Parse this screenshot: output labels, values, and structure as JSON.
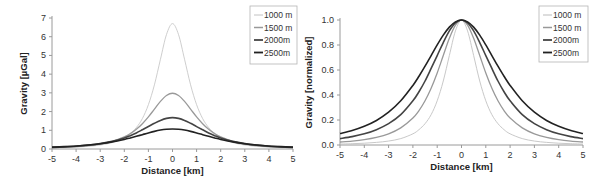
{
  "chart_data": [
    {
      "type": "line",
      "title": "",
      "xlabel": "Distance [km]",
      "ylabel": "Gravity [µGal]",
      "xlim": [
        -5,
        5
      ],
      "ylim": [
        0,
        7
      ],
      "xticks": [
        "-5",
        "-4",
        "-3",
        "-2",
        "-1",
        "0",
        "1",
        "2",
        "3",
        "4",
        "5"
      ],
      "yticks": [
        "0",
        "1",
        "2",
        "3",
        "4",
        "5",
        "6",
        "7"
      ],
      "legend_position": "top-right",
      "x": [
        -5,
        -4.5,
        -4,
        -3.5,
        -3,
        -2.5,
        -2,
        -1.75,
        -1.5,
        -1.25,
        -1,
        -0.75,
        -0.5,
        -0.25,
        0,
        0.25,
        0.5,
        0.75,
        1,
        1.25,
        1.5,
        1.75,
        2,
        2.5,
        3,
        3.5,
        4,
        4.5,
        5
      ],
      "series": [
        {
          "name": "1000 m",
          "color": "#c2c2c2",
          "values": [
            0.05,
            0.069,
            0.096,
            0.141,
            0.212,
            0.343,
            0.599,
            0.823,
            1.144,
            1.627,
            2.369,
            3.43,
            4.794,
            6.114,
            6.7,
            6.114,
            4.794,
            3.43,
            2.369,
            1.627,
            1.144,
            0.823,
            0.599,
            0.343,
            0.212,
            0.141,
            0.096,
            0.069,
            0.05
          ]
        },
        {
          "name": "1500 m",
          "color": "#999999",
          "values": [
            0.071,
            0.094,
            0.128,
            0.182,
            0.266,
            0.407,
            0.643,
            0.819,
            1.053,
            1.351,
            1.715,
            2.131,
            2.543,
            2.858,
            2.978,
            2.858,
            2.543,
            2.131,
            1.715,
            1.351,
            1.053,
            0.819,
            0.643,
            0.407,
            0.266,
            0.182,
            0.128,
            0.094,
            0.071
          ]
        },
        {
          "name": "2000m",
          "color": "#444444",
          "values": [
            0.086,
            0.112,
            0.15,
            0.206,
            0.286,
            0.407,
            0.592,
            0.714,
            0.858,
            1.026,
            1.198,
            1.373,
            1.529,
            1.636,
            1.675,
            1.636,
            1.529,
            1.373,
            1.198,
            1.026,
            0.858,
            0.714,
            0.592,
            0.407,
            0.286,
            0.206,
            0.15,
            0.112,
            0.086
          ]
        },
        {
          "name": "2500m",
          "color": "#222222",
          "values": [
            0.098,
            0.125,
            0.161,
            0.211,
            0.281,
            0.379,
            0.511,
            0.59,
            0.676,
            0.767,
            0.858,
            0.942,
            1.011,
            1.056,
            1.072,
            1.056,
            1.011,
            0.942,
            0.858,
            0.767,
            0.676,
            0.59,
            0.511,
            0.379,
            0.281,
            0.211,
            0.161,
            0.125,
            0.098
          ]
        }
      ]
    },
    {
      "type": "line",
      "title": "",
      "xlabel": "Distance [km]",
      "ylabel": "Gravity [normalized]",
      "xlim": [
        -5,
        5
      ],
      "ylim": [
        0,
        1.0
      ],
      "xticks": [
        "-5",
        "-4",
        "-3",
        "-2",
        "-1",
        "0",
        "1",
        "2",
        "3",
        "4",
        "5"
      ],
      "yticks": [
        "0.0",
        "0.2",
        "0.4",
        "0.6",
        "0.8",
        "1.0"
      ],
      "legend_position": "top-right",
      "x": [
        -5,
        -4.5,
        -4,
        -3.5,
        -3,
        -2.5,
        -2,
        -1.75,
        -1.5,
        -1.25,
        -1,
        -0.75,
        -0.5,
        -0.25,
        0,
        0.25,
        0.5,
        0.75,
        1,
        1.25,
        1.5,
        1.75,
        2,
        2.5,
        3,
        3.5,
        4,
        4.5,
        5
      ],
      "series": [
        {
          "name": "1000 m",
          "color": "#c2c2c2",
          "values": [
            0.0075,
            0.0103,
            0.0143,
            0.021,
            0.0316,
            0.0512,
            0.0894,
            0.1229,
            0.1707,
            0.2428,
            0.3536,
            0.512,
            0.7155,
            0.9126,
            1.0,
            0.9126,
            0.7155,
            0.512,
            0.3536,
            0.2428,
            0.1707,
            0.1229,
            0.0894,
            0.0512,
            0.0316,
            0.021,
            0.0143,
            0.0103,
            0.0075
          ]
        },
        {
          "name": "1500 m",
          "color": "#999999",
          "values": [
            0.024,
            0.0316,
            0.0431,
            0.0611,
            0.0894,
            0.1368,
            0.216,
            0.2751,
            0.3536,
            0.4537,
            0.576,
            0.7155,
            0.8538,
            0.9597,
            1.0,
            0.9597,
            0.8538,
            0.7155,
            0.576,
            0.4537,
            0.3536,
            0.2751,
            0.216,
            0.1368,
            0.0894,
            0.0611,
            0.0431,
            0.0316,
            0.024
          ]
        },
        {
          "name": "2000m",
          "color": "#444444",
          "values": [
            0.0512,
            0.067,
            0.0894,
            0.1229,
            0.1707,
            0.2428,
            0.3536,
            0.4262,
            0.512,
            0.6126,
            0.7155,
            0.8197,
            0.9126,
            0.977,
            1.0,
            0.977,
            0.9126,
            0.8197,
            0.7155,
            0.6126,
            0.512,
            0.4262,
            0.3536,
            0.2428,
            0.1707,
            0.1229,
            0.0894,
            0.067,
            0.0512
          ]
        },
        {
          "name": "2500m",
          "color": "#222222",
          "values": [
            0.0917,
            0.1164,
            0.15,
            0.1965,
            0.2621,
            0.3536,
            0.4768,
            0.55,
            0.6305,
            0.7155,
            0.8007,
            0.8788,
            0.9428,
            0.9852,
            1.0,
            0.9852,
            0.9428,
            0.8788,
            0.8007,
            0.7155,
            0.6305,
            0.55,
            0.4768,
            0.3536,
            0.2621,
            0.1965,
            0.15,
            0.1164,
            0.0917
          ]
        }
      ]
    }
  ]
}
